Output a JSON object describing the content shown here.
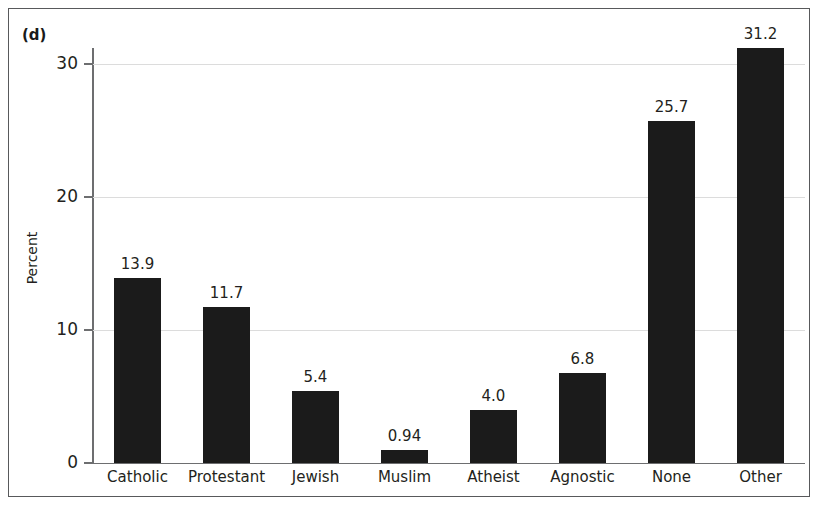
{
  "figure": {
    "panel_label": "(d)",
    "border_color": "#58595b",
    "bar_color": "#1b1b1b",
    "grid_color": "#dcdcdc",
    "axis_color": "#6d6e70"
  },
  "chart_data": {
    "type": "bar",
    "title": "",
    "subtitle": "",
    "xlabel": "",
    "ylabel": "Percent",
    "ylim": [
      0,
      32
    ],
    "yticks": [
      0,
      10,
      20,
      30
    ],
    "ytick_labels": [
      "0",
      "10",
      "20",
      "30"
    ],
    "grid": true,
    "grid_axis": "y",
    "legend": null,
    "categories": [
      "Catholic",
      "Protestant",
      "Jewish",
      "Muslim",
      "Atheist",
      "Agnostic",
      "None",
      "Other"
    ],
    "values": [
      13.9,
      11.7,
      5.4,
      0.94,
      4.0,
      6.8,
      25.7,
      31.2
    ],
    "value_labels": [
      "13.9",
      "11.7",
      "5.4",
      "0.94",
      "4.0",
      "6.8",
      "25.7",
      "31.2"
    ],
    "annotations": [
      "(d)"
    ]
  }
}
